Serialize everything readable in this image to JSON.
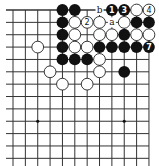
{
  "diagram": {
    "type": "go-board-corner",
    "corner": "top-right",
    "grid": {
      "cols_visible": 12,
      "rows_visible": 12,
      "x0": 13,
      "y0": 10,
      "spacing_x": 12.36,
      "spacing_y": 12.36,
      "line_left_extent": 6,
      "line_bottom_extent": 166
    },
    "star_points": [
      [
        3,
        10
      ],
      [
        10,
        10
      ]
    ],
    "stones": [
      {
        "c": 5,
        "r": 1,
        "color": "black"
      },
      {
        "c": 6,
        "r": 1,
        "color": "black"
      },
      {
        "c": 9,
        "r": 1,
        "color": "black",
        "label": "1"
      },
      {
        "c": 10,
        "r": 1,
        "color": "black",
        "label": "3"
      },
      {
        "c": 11,
        "r": 1,
        "color": "white"
      },
      {
        "c": 12,
        "r": 1,
        "color": "white",
        "label": "4"
      },
      {
        "c": 5,
        "r": 2,
        "color": "black"
      },
      {
        "c": 6,
        "r": 2,
        "color": "white"
      },
      {
        "c": 7,
        "r": 2,
        "color": "white",
        "label": "2"
      },
      {
        "c": 8,
        "r": 2,
        "color": "white"
      },
      {
        "c": 10,
        "r": 2,
        "color": "white"
      },
      {
        "c": 11,
        "r": 2,
        "color": "black"
      },
      {
        "c": 12,
        "r": 2,
        "color": "black"
      },
      {
        "c": 5,
        "r": 3,
        "color": "black"
      },
      {
        "c": 6,
        "r": 3,
        "color": "white"
      },
      {
        "c": 8,
        "r": 3,
        "color": "white"
      },
      {
        "c": 9,
        "r": 3,
        "color": "white"
      },
      {
        "c": 10,
        "r": 3,
        "color": "black"
      },
      {
        "c": 11,
        "r": 3,
        "color": "white"
      },
      {
        "c": 12,
        "r": 3,
        "color": "white"
      },
      {
        "c": 3,
        "r": 4,
        "color": "white"
      },
      {
        "c": 5,
        "r": 4,
        "color": "black"
      },
      {
        "c": 6,
        "r": 4,
        "color": "white"
      },
      {
        "c": 7,
        "r": 4,
        "color": "white"
      },
      {
        "c": 8,
        "r": 4,
        "color": "black"
      },
      {
        "c": 9,
        "r": 4,
        "color": "black"
      },
      {
        "c": 10,
        "r": 4,
        "color": "black"
      },
      {
        "c": 11,
        "r": 4,
        "color": "black"
      },
      {
        "c": 12,
        "r": 4,
        "color": "black",
        "label": "7"
      },
      {
        "c": 5,
        "r": 5,
        "color": "black"
      },
      {
        "c": 6,
        "r": 5,
        "color": "black"
      },
      {
        "c": 7,
        "r": 5,
        "color": "black"
      },
      {
        "c": 8,
        "r": 5,
        "color": "white"
      },
      {
        "c": 4,
        "r": 6,
        "color": "white"
      },
      {
        "c": 8,
        "r": 6,
        "color": "white"
      },
      {
        "c": 10,
        "r": 6,
        "color": "black"
      },
      {
        "c": 5,
        "r": 7,
        "color": "white"
      },
      {
        "c": 7,
        "r": 7,
        "color": "white"
      }
    ],
    "letters": [
      {
        "c": 8,
        "r": 1,
        "text": "b"
      },
      {
        "c": 9,
        "r": 2,
        "text": "a"
      }
    ]
  }
}
